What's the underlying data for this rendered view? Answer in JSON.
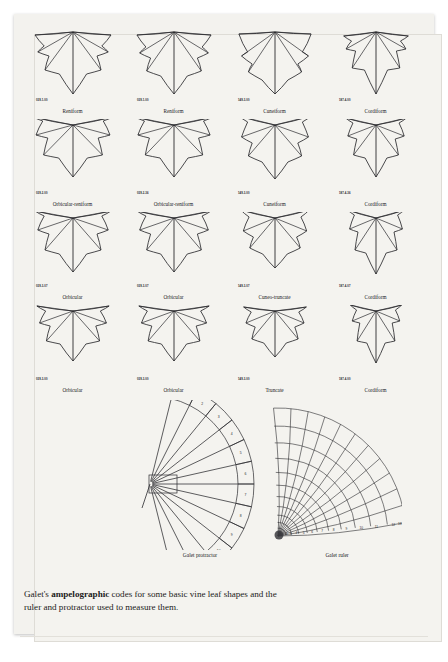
{
  "figure": {
    "caption_prefix": "Galet's ",
    "caption_bold": "ampelographic",
    "caption_suffix": " codes for some basic vine leaf shapes and the ruler and protractor used to measure them."
  },
  "leaf_grid": {
    "rows": 4,
    "columns": 4,
    "items": [
      {
        "code": "039-1-00",
        "name": "Reniform",
        "shape": "reniform-a"
      },
      {
        "code": "039-1-00",
        "name": "Reniform",
        "shape": "reniform-b"
      },
      {
        "code": "149-3-00",
        "name": "Cuneiform",
        "shape": "cuneiform-a"
      },
      {
        "code": "187-4-00",
        "name": "Cordiform",
        "shape": "cordiform-a"
      },
      {
        "code": "039-2-00",
        "name": "Orbicular-reniform",
        "shape": "orb-reniform-a"
      },
      {
        "code": "039-2-36",
        "name": "Orbicular-reniform",
        "shape": "orb-reniform-b"
      },
      {
        "code": "149-3-00",
        "name": "Cuneiform",
        "shape": "cuneiform-b"
      },
      {
        "code": "187-4-36",
        "name": "Cordiform",
        "shape": "cordiform-b"
      },
      {
        "code": "039-3-07",
        "name": "Orbicular",
        "shape": "orbicular-a"
      },
      {
        "code": "039-3-07",
        "name": "Orbicular",
        "shape": "orbicular-b"
      },
      {
        "code": "149-3-07",
        "name": "Cuneo-truncate",
        "shape": "cuneo-truncate"
      },
      {
        "code": "187-4-07",
        "name": "Cordiform",
        "shape": "cordiform-c"
      },
      {
        "code": "039-3-00",
        "name": "Orbicular",
        "shape": "orbicular-c"
      },
      {
        "code": "039-3-00",
        "name": "Orbicular",
        "shape": "orbicular-d"
      },
      {
        "code": "149-3-00",
        "name": "Truncate",
        "shape": "truncate"
      },
      {
        "code": "187-4-00",
        "name": "Cordiform",
        "shape": "cordiform-d"
      }
    ]
  },
  "instruments": [
    {
      "id": "galet-protractor",
      "label": "Galet protractor",
      "sectors": 12,
      "tick_labels": [
        "1",
        "2",
        "3",
        "4",
        "5",
        "6",
        "7",
        "8",
        "9",
        "10",
        "11",
        "12"
      ]
    },
    {
      "id": "galet-ruler",
      "label": "Galet ruler",
      "arcs": 13,
      "rays": 11,
      "tick_labels": [
        "1",
        "2",
        "3",
        "4",
        "5",
        "6",
        "7",
        "8",
        "9",
        "10",
        "11",
        "12",
        "13"
      ]
    }
  ],
  "colors": {
    "page_background": "#ffffff",
    "plate_background": "#f3f2ee",
    "panel_background": "#f4f3ef",
    "panel_border": "#dedcd6",
    "ink": "#17171b",
    "line": "#2a2a2e"
  }
}
